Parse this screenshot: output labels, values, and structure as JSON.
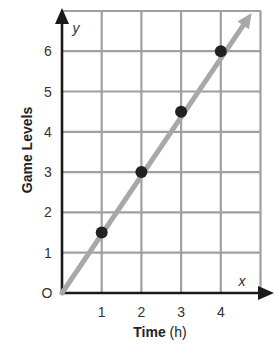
{
  "chart_data": {
    "type": "scatter",
    "title": "",
    "xlabel": "Time (h)",
    "xlabel_main": "Time",
    "xlabel_unit": "(h)",
    "ylabel": "Game Levels",
    "x_axis_letter": "x",
    "y_axis_letter": "y",
    "origin_label": "O",
    "xlim": [
      0,
      5
    ],
    "ylim": [
      0,
      7
    ],
    "xticks": [
      1,
      2,
      3,
      4
    ],
    "yticks": [
      1,
      2,
      3,
      4,
      5,
      6
    ],
    "grid": true,
    "series": [
      {
        "name": "Game Levels",
        "x": [
          1,
          2,
          3,
          4
        ],
        "y": [
          1.5,
          3,
          4.5,
          6
        ],
        "marker": "circle",
        "color": "#222222"
      }
    ],
    "trend_line": {
      "equation": "y = 1.5x",
      "from": [
        0,
        0
      ],
      "to": [
        4.6,
        6.9
      ],
      "arrow": true,
      "color": "#a8a8a8"
    },
    "legend": null
  }
}
